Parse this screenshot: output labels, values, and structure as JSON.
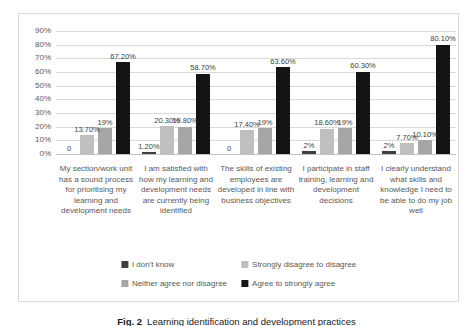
{
  "figure": {
    "caption_label": "Fig. 2",
    "caption_text": "Learning identification and development practices"
  },
  "chart_data": {
    "type": "bar",
    "title": "",
    "xlabel": "",
    "ylabel": "",
    "ylim": [
      0,
      90
    ],
    "ytick_step": 10,
    "ytick_labels": [
      "0%",
      "10%",
      "20%",
      "30%",
      "40%",
      "50%",
      "60%",
      "70%",
      "80%",
      "90%"
    ],
    "grid": true,
    "legend_position": "bottom-inside",
    "categories": [
      "My section/work unit has a sound process for prioritising my learning and development needs",
      "I am satisfied with how my learning and development needs are currently being identified",
      "The skills of existing employees are developed in line with business objectives",
      "I participate in staff training, learning and development decisions",
      "I clearly understand what skills and knowledge I need to be able to do my job well"
    ],
    "series": [
      {
        "name": "I don't know",
        "color": "#3f3f3f",
        "values": [
          0,
          1.2,
          0,
          2,
          2
        ],
        "labels": [
          "0",
          "1.20%",
          "0",
          "2%",
          "2%"
        ]
      },
      {
        "name": "Strongly disagree to disagree",
        "color": "#bfbfbf",
        "values": [
          13.7,
          20.3,
          17.4,
          18.6,
          7.7
        ],
        "labels": [
          "13.70%",
          "20.30%",
          "17.40%",
          "18.60%",
          "7.70%"
        ]
      },
      {
        "name": "Neither agree nor disagree",
        "color": "#a6a6a6",
        "values": [
          19,
          19.8,
          19,
          19,
          10.1
        ],
        "labels": [
          "19%",
          "19.80%",
          "19%",
          "19%",
          "10.10%"
        ]
      },
      {
        "name": "Agree to strongly agree",
        "color": "#141414",
        "values": [
          67.2,
          58.7,
          63.6,
          60.3,
          80.1
        ],
        "labels": [
          "67.20%",
          "58.70%",
          "63.60%",
          "60.30%",
          "80.10%"
        ]
      }
    ]
  }
}
